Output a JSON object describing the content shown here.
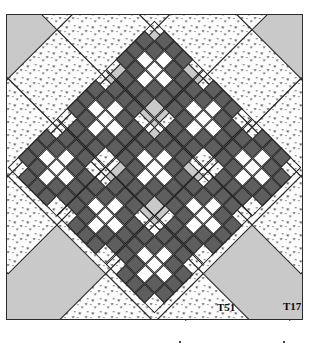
{
  "diagram": {
    "kind": "quilt-layout-diagram",
    "set": "on-point",
    "frame": {
      "border_color": "#2b2b2b",
      "background_color": "#c9c9c9"
    },
    "colors": {
      "dark_fabric": "#5e5e5e",
      "light_fabric": "#ffffff",
      "print_background": "#fbfbfb",
      "speckle_ink": "#3a3a3a",
      "sashing_background": "#c9c9c9",
      "outline": "#1f1f1f"
    },
    "grid": {
      "block_rows": 3,
      "block_cols": 3,
      "block_units": 5
    },
    "block": {
      "name": "album-cross-block",
      "rows": [
        [
          "t",
          "d",
          "d",
          "d",
          "t"
        ],
        [
          "d",
          "d",
          "w",
          "d",
          "d"
        ],
        [
          "d",
          "w",
          "w",
          "w",
          "d"
        ],
        [
          "d",
          "d",
          "w",
          "d",
          "d"
        ],
        [
          "t",
          "d",
          "d",
          "d",
          "t"
        ]
      ]
    },
    "alternate_square": {
      "name": "print-setting-square",
      "fabric": "speckled-print"
    },
    "labels": [
      {
        "name": "label-t51",
        "text": "T51"
      },
      {
        "name": "label-t17",
        "text": "T17"
      }
    ],
    "registration_marks": {
      "top": 2,
      "bottom": 2,
      "style": "diagonal-dashed"
    }
  }
}
